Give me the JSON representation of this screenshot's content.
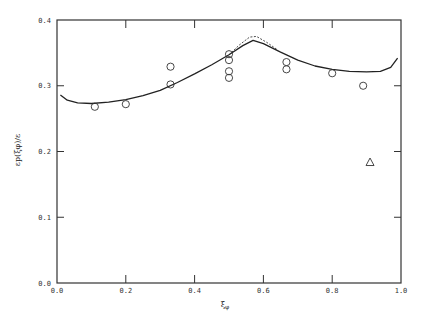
{
  "chart_data": {
    "type": "line",
    "title": "",
    "xlabel": "ξφ",
    "ylabel": "εp(ξφ)/ε",
    "xlim": [
      0.0,
      1.0
    ],
    "ylim": [
      0.0,
      0.4
    ],
    "xticks": [
      "0.0",
      "0.2",
      "0.4",
      "0.6",
      "0.8",
      "1.0"
    ],
    "yticks": [
      "0.0",
      "0.1",
      "0.2",
      "0.3",
      "0.4"
    ],
    "grid": false,
    "legend": null,
    "series": [
      {
        "name": "model (solid)",
        "style": "solid",
        "x": [
          0.01,
          0.03,
          0.06,
          0.1,
          0.15,
          0.2,
          0.25,
          0.3,
          0.35,
          0.4,
          0.45,
          0.5,
          0.54,
          0.57,
          0.6,
          0.65,
          0.7,
          0.75,
          0.8,
          0.85,
          0.9,
          0.94,
          0.97,
          0.99
        ],
        "y": [
          0.286,
          0.278,
          0.274,
          0.273,
          0.275,
          0.279,
          0.285,
          0.293,
          0.305,
          0.318,
          0.332,
          0.347,
          0.361,
          0.369,
          0.364,
          0.351,
          0.339,
          0.33,
          0.325,
          0.322,
          0.321,
          0.322,
          0.328,
          0.342
        ]
      },
      {
        "name": "model (dashed)",
        "style": "dashed",
        "x": [
          0.5,
          0.53,
          0.56,
          0.58,
          0.61,
          0.64
        ],
        "y": [
          0.347,
          0.362,
          0.374,
          0.375,
          0.366,
          0.355
        ]
      },
      {
        "name": "data (circles)",
        "style": "marker-circle",
        "x": [
          0.11,
          0.2,
          0.33,
          0.33,
          0.5,
          0.5,
          0.5,
          0.5,
          0.667,
          0.667,
          0.8,
          0.89
        ],
        "y": [
          0.268,
          0.272,
          0.329,
          0.302,
          0.348,
          0.339,
          0.322,
          0.312,
          0.336,
          0.325,
          0.319,
          0.3
        ]
      },
      {
        "name": "data (triangle)",
        "style": "marker-triangle",
        "x": [
          0.91
        ],
        "y": [
          0.184
        ]
      }
    ]
  },
  "axes": {
    "xlabel_main": "ξ",
    "xlabel_sub": "φ",
    "ylabel": "εp(ξφ)/ε"
  }
}
